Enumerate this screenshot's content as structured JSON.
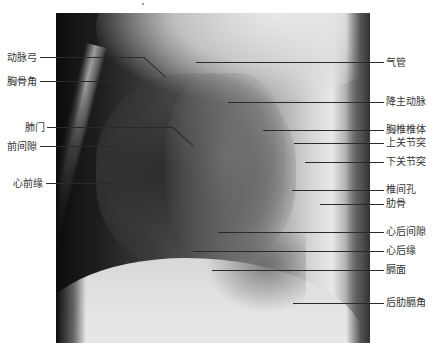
{
  "figure": {
    "type": "lateral chest radiograph with anatomical labels",
    "left_labels": [
      {
        "text": "动脉弓",
        "y": 58
      },
      {
        "text": "胸骨角",
        "y": 82
      },
      {
        "text": "肺门",
        "y": 128
      },
      {
        "text": "前间隙",
        "y": 147
      },
      {
        "text": "心前缘",
        "y": 184
      }
    ],
    "right_labels": [
      {
        "text": "气管",
        "y": 63
      },
      {
        "text": "降主动脉",
        "y": 102
      },
      {
        "text": "胸椎椎体",
        "y": 130
      },
      {
        "text": "上关节突",
        "y": 143
      },
      {
        "text": "下关节突",
        "y": 161
      },
      {
        "text": "椎间孔",
        "y": 190
      },
      {
        "text": "肋骨",
        "y": 204
      },
      {
        "text": "心后间隙",
        "y": 232
      },
      {
        "text": "心后缘",
        "y": 251
      },
      {
        "text": "膈面",
        "y": 270
      },
      {
        "text": "后肋膈角",
        "y": 303
      }
    ]
  }
}
